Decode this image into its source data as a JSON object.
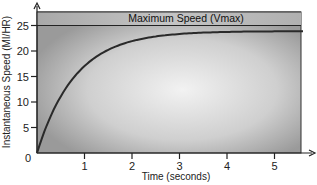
{
  "chart_data": {
    "type": "line",
    "title": "",
    "xlabel": "Time (seconds)",
    "ylabel": "Instantaneous Speed (MI/HR)",
    "xlim": [
      0,
      5.7
    ],
    "ylim": [
      0,
      27.5
    ],
    "x_ticks": [
      1,
      2,
      3,
      4,
      5
    ],
    "y_ticks": [
      0,
      5,
      10,
      15,
      20,
      25
    ],
    "grid": false,
    "legend": null,
    "annotations": [
      {
        "text": "Maximum Speed (Vmax)",
        "type": "horizontal-band",
        "y_from": 25,
        "y_to": 27.5
      }
    ],
    "series": [
      {
        "name": "Instantaneous Speed",
        "x": [
          0,
          0.25,
          0.5,
          0.75,
          1,
          1.5,
          2,
          2.5,
          3,
          3.5,
          4,
          4.5,
          5,
          5.5,
          5.7
        ],
        "values": [
          0,
          6.5,
          11.2,
          14.4,
          17.1,
          20.0,
          21.6,
          22.5,
          23.0,
          23.3,
          23.5,
          23.6,
          23.7,
          23.8,
          23.8
        ]
      }
    ],
    "vmax_line": 25
  },
  "labels": {
    "vmax": "Maximum Speed (Vmax)",
    "xlabel": "Time (seconds)",
    "ylabel": "Instantaneous Speed (MI/HR)",
    "x_ticks": [
      "1",
      "2",
      "3",
      "4",
      "5"
    ],
    "y_ticks": [
      "0",
      "5",
      "10",
      "15",
      "20",
      "25"
    ]
  }
}
